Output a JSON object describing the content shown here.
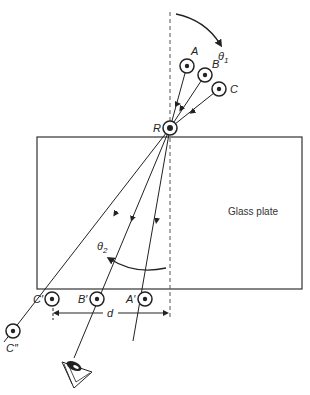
{
  "figure": {
    "type": "refraction-through-glass-plate",
    "plate_label": "Glass plate",
    "colors": {
      "line": "#222222",
      "dashed": "#555555",
      "background": "#ffffff"
    }
  },
  "labels": {
    "theta1": "θ",
    "theta1_sub": "1",
    "theta2": "θ",
    "theta2_sub": "2",
    "pin_A": "A",
    "pin_B": "B",
    "pin_C": "C",
    "pin_R": "R",
    "pin_A_prime": "A′",
    "pin_B_prime": "B′",
    "pin_C_prime": "C′",
    "pin_C_double_prime": "C″",
    "distance": "d"
  },
  "icons": {
    "pin": "circle-with-dot",
    "eye": "eye-icon"
  }
}
